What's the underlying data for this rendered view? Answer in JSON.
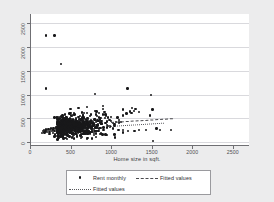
{
  "chart_data": {
    "type": "scatter",
    "title": "",
    "xlabel": "Home size in sqft.",
    "ylabel": "",
    "xlim": [
      0,
      2700
    ],
    "ylim": [
      -60,
      2700
    ],
    "xticks": [
      0,
      500,
      1000,
      1500,
      2000,
      2500
    ],
    "yticks": [
      0,
      500,
      1000,
      1500,
      2000,
      2500
    ],
    "xtick_labels": [
      "0",
      "500",
      "1000",
      "1500",
      "2000",
      "2500"
    ],
    "ytick_labels": [
      "0",
      "500",
      "1000",
      "1500",
      "2000",
      "2500"
    ],
    "grid": "horizontal",
    "legend_position": "below-plot",
    "legend": [
      {
        "label": "Rent monthly",
        "marker": "filled-circle",
        "style": "scatter"
      },
      {
        "label": "Fitted values",
        "marker": "dashed-line",
        "style": "line"
      },
      {
        "label": "Fitted values",
        "marker": "dotted-line",
        "style": "line"
      }
    ],
    "series": [
      {
        "name": "Rent monthly",
        "marker": "filled-circle",
        "color": "#18181a",
        "points": [
          [
            200,
            2250
          ],
          [
            300,
            2250
          ],
          [
            380,
            1650
          ],
          [
            200,
            1130
          ],
          [
            800,
            1020
          ],
          [
            1200,
            1130
          ],
          [
            1490,
            990
          ],
          [
            1510,
            690
          ],
          [
            1480,
            560
          ],
          [
            1520,
            25
          ],
          [
            1740,
            260
          ],
          [
            1600,
            250
          ],
          [
            1560,
            290
          ],
          [
            1430,
            255
          ],
          [
            1340,
            250
          ],
          [
            1290,
            240
          ],
          [
            1210,
            235
          ],
          [
            1150,
            250
          ],
          [
            1090,
            255
          ],
          [
            1040,
            160
          ],
          [
            1230,
            650
          ],
          [
            1250,
            620
          ],
          [
            1280,
            660
          ],
          [
            1340,
            640
          ],
          [
            1300,
            700
          ],
          [
            1190,
            600
          ],
          [
            1150,
            560
          ],
          [
            1120,
            430
          ],
          [
            1100,
            470
          ],
          [
            1080,
            520
          ],
          [
            1060,
            420
          ],
          [
            1040,
            380
          ],
          [
            1020,
            400
          ],
          [
            1000,
            440
          ],
          [
            980,
            470
          ],
          [
            960,
            520
          ],
          [
            940,
            560
          ],
          [
            920,
            640
          ],
          [
            900,
            700
          ],
          [
            880,
            440
          ],
          [
            870,
            400
          ],
          [
            860,
            480
          ],
          [
            850,
            520
          ],
          [
            840,
            380
          ],
          [
            830,
            440
          ],
          [
            820,
            360
          ],
          [
            810,
            420
          ],
          [
            800,
            470
          ],
          [
            790,
            390
          ],
          [
            780,
            430
          ],
          [
            770,
            340
          ],
          [
            760,
            400
          ],
          [
            750,
            460
          ],
          [
            740,
            380
          ],
          [
            730,
            420
          ],
          [
            720,
            350
          ],
          [
            710,
            400
          ],
          [
            700,
            440
          ],
          [
            690,
            360
          ],
          [
            680,
            420
          ],
          [
            670,
            380
          ],
          [
            660,
            330
          ],
          [
            650,
            400
          ],
          [
            640,
            440
          ],
          [
            630,
            350
          ],
          [
            620,
            390
          ],
          [
            610,
            420
          ],
          [
            600,
            360
          ],
          [
            590,
            330
          ],
          [
            580,
            400
          ],
          [
            570,
            370
          ],
          [
            560,
            340
          ],
          [
            550,
            390
          ],
          [
            540,
            420
          ],
          [
            530,
            350
          ],
          [
            520,
            310
          ],
          [
            510,
            370
          ],
          [
            500,
            400
          ],
          [
            490,
            340
          ],
          [
            480,
            300
          ],
          [
            470,
            360
          ],
          [
            460,
            330
          ],
          [
            450,
            290
          ],
          [
            440,
            350
          ],
          [
            430,
            320
          ],
          [
            420,
            280
          ],
          [
            410,
            340
          ],
          [
            400,
            310
          ],
          [
            390,
            270
          ],
          [
            380,
            330
          ],
          [
            370,
            300
          ],
          [
            360,
            260
          ],
          [
            350,
            320
          ],
          [
            340,
            290
          ],
          [
            330,
            250
          ],
          [
            320,
            310
          ],
          [
            310,
            280
          ],
          [
            300,
            240
          ],
          [
            290,
            300
          ],
          [
            280,
            270
          ],
          [
            270,
            230
          ],
          [
            260,
            290
          ],
          [
            250,
            260
          ],
          [
            240,
            220
          ],
          [
            230,
            280
          ],
          [
            220,
            250
          ],
          [
            210,
            210
          ],
          [
            200,
            270
          ],
          [
            190,
            240
          ],
          [
            180,
            200
          ],
          [
            170,
            260
          ],
          [
            160,
            230
          ],
          [
            150,
            190
          ],
          [
            300,
            520
          ],
          [
            350,
            480
          ],
          [
            400,
            560
          ],
          [
            450,
            520
          ],
          [
            500,
            620
          ],
          [
            550,
            580
          ],
          [
            600,
            530
          ],
          [
            650,
            560
          ],
          [
            700,
            620
          ],
          [
            750,
            580
          ],
          [
            800,
            660
          ],
          [
            850,
            620
          ],
          [
            900,
            580
          ],
          [
            500,
            700
          ],
          [
            600,
            720
          ],
          [
            700,
            740
          ],
          [
            900,
            760
          ],
          [
            1150,
            690
          ],
          [
            1260,
            720
          ],
          [
            950,
            360
          ],
          [
            870,
            300
          ],
          [
            760,
            290
          ],
          [
            640,
            270
          ],
          [
            520,
            250
          ],
          [
            430,
            230
          ],
          [
            350,
            210
          ],
          [
            280,
            190
          ],
          [
            240,
            170
          ],
          [
            310,
            160
          ],
          [
            410,
            175
          ],
          [
            560,
            185
          ],
          [
            680,
            170
          ],
          [
            810,
            180
          ],
          [
            930,
            165
          ],
          [
            1050,
            95
          ],
          [
            640,
            110
          ],
          [
            480,
            130
          ],
          [
            390,
            140
          ],
          [
            300,
            120
          ]
        ]
      }
    ],
    "fits": [
      {
        "name": "Fitted values",
        "style": "dashed",
        "x": [
          1000,
          1760
        ],
        "y": [
          420,
          500
        ]
      },
      {
        "name": "Fitted values",
        "style": "dotted",
        "x": [
          980,
          1660
        ],
        "y": [
          330,
          400
        ]
      }
    ]
  }
}
